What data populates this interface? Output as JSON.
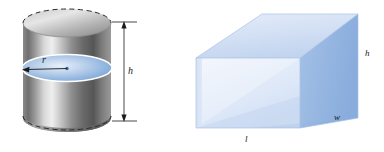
{
  "figure": {
    "background_color": "#ffffff",
    "width": 384,
    "height": 152,
    "shapes": [
      {
        "id": "cylinder",
        "name": "cylinder",
        "labels": [
          "r",
          "h"
        ],
        "description": "gray metallic cylinder with blue cross-sectional disk"
      },
      {
        "id": "box",
        "name": "rectangular-prism",
        "labels": [
          "l",
          "w",
          "h"
        ],
        "description": "translucent blue rectangular box"
      }
    ]
  },
  "cylinder": {
    "radius_label": "r",
    "height_label": "h",
    "body_color_dark": "#5b5b5b",
    "body_color_light": "#e2e2e2",
    "disk_color": "#8fb6e0",
    "disk_edge_color": "#ffffff",
    "dashed_color": "#2b2b2b",
    "dimension_line_color": "#1a1a1a"
  },
  "box": {
    "length_label": "l",
    "width_label": "w",
    "height_label": "h",
    "face_front_color": "#c3d4ee",
    "face_right_color": "#8fb0de",
    "face_top_color": "#dbe6f7",
    "face_inner_color": "#eaf0fb",
    "edge_color": "#aac4e6"
  }
}
